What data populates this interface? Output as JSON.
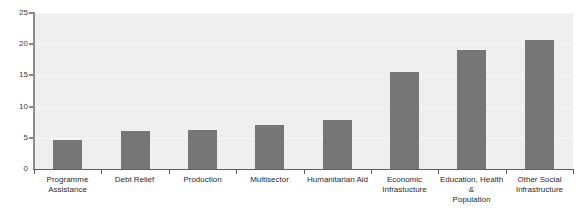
{
  "chart_data": {
    "type": "bar",
    "title": "",
    "xlabel": "",
    "ylabel": "",
    "ylim": [
      0,
      25
    ],
    "yticks": [
      "0",
      "5",
      "10",
      "15",
      "20",
      "25"
    ],
    "grid": true,
    "legend": null,
    "bar_color": "#767676",
    "plot_background": "#efefef",
    "categories": [
      "Programme\nAssistance",
      "Debt Relief",
      "Production",
      "Multisector",
      "Humanitarian Aid",
      "Economic\nInfrastucture",
      "Education, Health &\nPopulation",
      "Other Social\nInfrastructure"
    ],
    "values": [
      4.6,
      6.1,
      6.2,
      7.0,
      7.8,
      15.5,
      19.1,
      20.7
    ]
  },
  "ghost_title": ""
}
